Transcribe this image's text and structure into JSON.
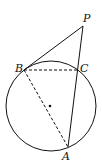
{
  "diagram": {
    "type": "geometry",
    "points": {
      "P": {
        "label": "P",
        "x": 83,
        "y": 26
      },
      "B": {
        "label": "B",
        "x": 24,
        "y": 70
      },
      "C": {
        "label": "C",
        "x": 78,
        "y": 70
      },
      "A": {
        "label": "A",
        "x": 68,
        "y": 147
      }
    },
    "circle": {
      "cx": 51,
      "cy": 106,
      "r": 45,
      "center_marked": true
    },
    "segments": [
      {
        "from": "P",
        "to": "B",
        "style": "solid"
      },
      {
        "from": "P",
        "to": "A",
        "style": "solid"
      },
      {
        "from": "B",
        "to": "C",
        "style": "dashed"
      },
      {
        "from": "B",
        "to": "A",
        "style": "dashed"
      }
    ],
    "colors": {
      "stroke": "#111111",
      "background": "#ffffff"
    }
  }
}
